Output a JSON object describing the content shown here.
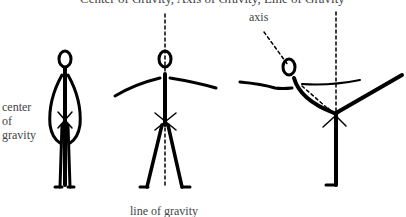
{
  "title": "Center of Gravity, Axis of Gravity, Line of Gravity",
  "labels": {
    "center_line1": "center",
    "center_line2": "of",
    "center_line3": "gravity",
    "line_of_gravity": "line of gravity",
    "axis": "axis"
  },
  "figures": [
    {
      "name": "standing-figure",
      "pose": "arms at sides"
    },
    {
      "name": "arms-out-figure",
      "pose": "arms outstretched, legs apart"
    },
    {
      "name": "arabesque-figure",
      "pose": "leaning forward on one leg, other leg raised"
    }
  ],
  "colors": {
    "ink": "#000000",
    "text": "#444444",
    "background": "#ffffff"
  }
}
